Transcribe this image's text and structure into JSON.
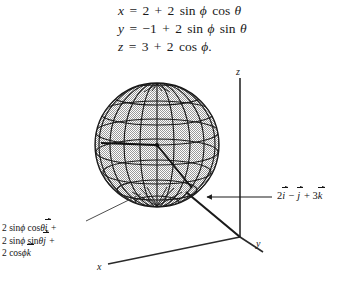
{
  "figure": {
    "background_color": "#ffffff",
    "ink_color": "#151515"
  },
  "equations": {
    "lines": [
      {
        "lhs": "x",
        "rhs": "2 + 2 sin ϕ cos θ"
      },
      {
        "lhs": "y",
        "rhs": "−1 + 2 sin ϕ sin θ"
      },
      {
        "lhs": "z",
        "rhs": "3 + 2 cos ϕ."
      }
    ],
    "eq1": {
      "var": "x",
      "eq": "=",
      "c": "2",
      "plus": "+",
      "coef": "2",
      "sin": "sin",
      "phi": "ϕ",
      "cos": "cos",
      "theta": "θ"
    },
    "eq2": {
      "var": "y",
      "eq": "=",
      "c": "−1",
      "plus": "+",
      "coef": "2",
      "sin1": "sin",
      "phi": "ϕ",
      "sin2": "sin",
      "theta": "θ"
    },
    "eq3": {
      "var": "z",
      "eq": "=",
      "c": "3",
      "plus": "+",
      "coef": "2",
      "cos": "cos",
      "phi": "ϕ",
      "period": "."
    }
  },
  "annotations": {
    "left": {
      "label": "radius-vector-components",
      "line1": {
        "coef": "2",
        "fn1": "sin",
        "phi": "ϕ",
        "fn2": "cos",
        "theta": "θ",
        "unit": "i",
        "plus": "+"
      },
      "line2": {
        "coef": "2",
        "fn1": "sin",
        "phi": "ϕ",
        "fn2": "sin",
        "theta": "θ",
        "unit": "j",
        "plus": "+"
      },
      "line3": {
        "coef": "2",
        "fn1": "cos",
        "phi": "ϕ",
        "unit": "k"
      },
      "text": "2 sin ϕ cos θ i⃗ + 2 sin ϕ sin θ j⃗ + 2 cos ϕ k⃗"
    },
    "right": {
      "label": "center-position-vector",
      "coef_i": "2",
      "unit_i": "i",
      "minus": "−",
      "unit_j": "j",
      "plus": "+",
      "coef_k": "3",
      "unit_k": "k",
      "text": "2i⃗ − j⃗ + 3k⃗"
    }
  },
  "axes": {
    "z_label": "z",
    "y_label": "y",
    "x_label": "x",
    "origin": {
      "x": 240,
      "y": 237
    },
    "z_tip": {
      "x": 240,
      "y": 78
    },
    "y_tip": {
      "x": 263,
      "y": 252
    },
    "x_tip": {
      "x": 108,
      "y": 264
    }
  },
  "sphere": {
    "center": {
      "x": 157,
      "y": 145
    },
    "radius": 62,
    "radius_value": 2,
    "center_point": [
      2,
      -1,
      3
    ],
    "fill": "#b9b9b9",
    "stroke": "#1a1a1a",
    "meridians": 12,
    "parallels": 7
  },
  "leaders": {
    "left_leader": {
      "from": {
        "x": 86,
        "y": 221
      },
      "to": {
        "x": 141,
        "y": 194
      }
    },
    "right_arrow": {
      "from": {
        "x": 272,
        "y": 197
      },
      "to": {
        "x": 206,
        "y": 197
      }
    }
  }
}
